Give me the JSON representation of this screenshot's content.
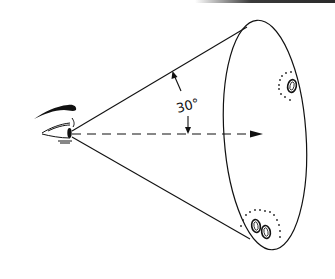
{
  "diagram": {
    "title": "",
    "angle_label": "30°",
    "elements": [
      {
        "name": "eye",
        "description": "Stylized eye with eyebrow at cone apex"
      },
      {
        "name": "view-cone",
        "description": "Cone of vision from eye to elliptical field"
      },
      {
        "name": "line-of-sight",
        "description": "Dashed central axis with arrowhead"
      },
      {
        "name": "field-ellipse",
        "description": "Elliptical base of the viewing cone"
      },
      {
        "name": "object-single",
        "description": "Single 0-shaped object with dotted halo, upper right of field"
      },
      {
        "name": "object-pair",
        "description": "Pair of 0-shaped objects with dotted halo, bottom of field"
      }
    ],
    "colors": {
      "ink": "#111111",
      "paper": "#ffffff"
    }
  }
}
